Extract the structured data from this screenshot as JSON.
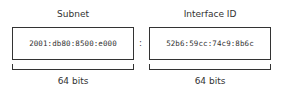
{
  "diagram": {
    "left": {
      "title": "Subnet",
      "value": "2001:db80:8500:e000",
      "bits": "64 bits"
    },
    "separator": ":",
    "right": {
      "title": "Interface ID",
      "value": "52b6:59cc:74c9:8b6c",
      "bits": "64 bits"
    }
  }
}
